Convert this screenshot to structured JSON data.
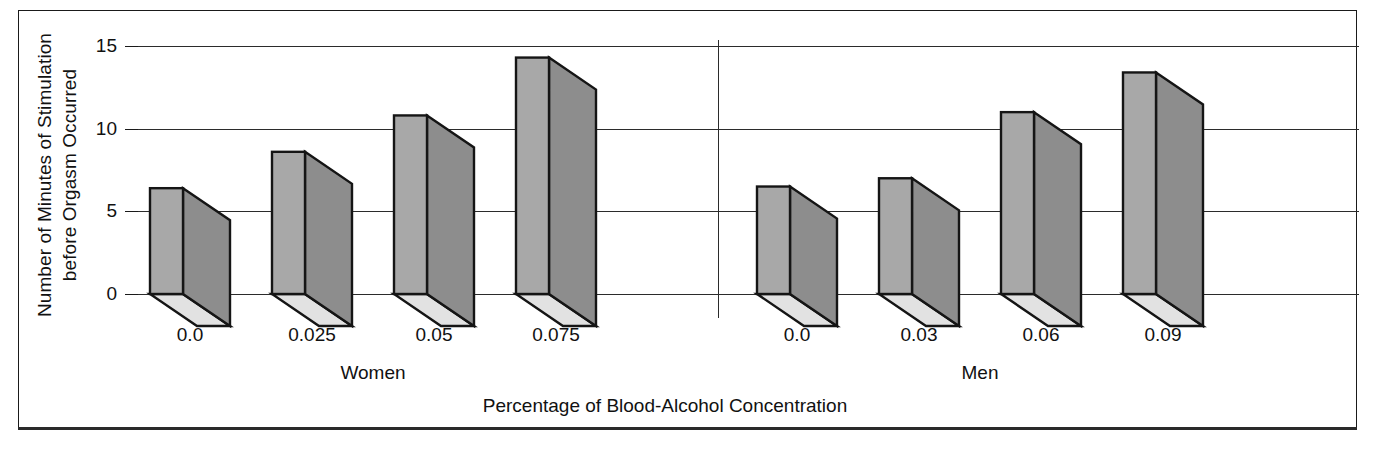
{
  "figure": {
    "y_axis_title_line1": "Number of Minutes of Stimulation",
    "y_axis_title_line2": "before Orgasm Occurred",
    "x_axis_title": "Percentage of Blood-Alcohol Concentration",
    "group_labels": [
      "Women",
      "Men"
    ],
    "y_tick_labels": [
      "0",
      "5",
      "10",
      "15"
    ]
  },
  "chart_data": {
    "type": "bar",
    "title": "",
    "subtitle": "",
    "xlabel": "Percentage of Blood-Alcohol Concentration",
    "ylabel": "Number of Minutes of Stimulation before Orgasm Occurred",
    "ylim": [
      0,
      15
    ],
    "yticks": [
      0,
      5,
      10,
      15
    ],
    "grid": true,
    "legend": "none",
    "style": "3d-bar",
    "groups": [
      {
        "name": "Women",
        "categories": [
          "0.0",
          "0.025",
          "0.05",
          "0.075"
        ],
        "values": [
          6.4,
          8.6,
          10.8,
          14.3
        ]
      },
      {
        "name": "Men",
        "categories": [
          "0.0",
          "0.03",
          "0.06",
          "0.09"
        ],
        "values": [
          6.5,
          7.0,
          11.0,
          13.4
        ]
      }
    ],
    "categories": [
      "0.0",
      "0.025",
      "0.05",
      "0.075",
      "0.0",
      "0.03",
      "0.06",
      "0.09"
    ],
    "values": [
      6.4,
      8.6,
      10.8,
      14.3,
      6.5,
      7.0,
      11.0,
      13.4
    ],
    "colors": {
      "bar_front": "#a8a8a8",
      "bar_side": "#8d8d8d",
      "bar_bottom": "#e2e2e2",
      "outline": "#151515",
      "gridline": "#2b2b2b",
      "background": "#ffffff"
    }
  }
}
